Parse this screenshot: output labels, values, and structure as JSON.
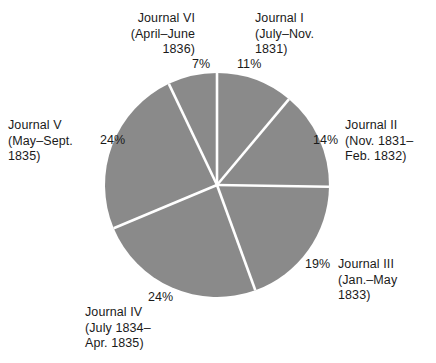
{
  "chart_data": {
    "type": "pie",
    "title": "",
    "labels": [
      "Journal I (July–Nov. 1831)",
      "Journal II (Nov. 1831–Feb. 1832)",
      "Journal III (Jan.–May 1833)",
      "Journal IV (July 1834–Apr. 1835)",
      "Journal V (May–Sept. 1835)",
      "Journal VI (April–June 1836)"
    ],
    "values": [
      11,
      14,
      19,
      24,
      24,
      7
    ],
    "units": "percent",
    "start_angle_deg": 0,
    "direction": "clockwise",
    "legend": "none",
    "slice_color": "#8a8a8a",
    "divider_color": "#ffffff"
  },
  "slices": [
    {
      "id": "journal-i",
      "name": "Journal I",
      "date_line1": "(July–Nov.",
      "date_line2": "1831)",
      "percent": "11%",
      "value": 11
    },
    {
      "id": "journal-ii",
      "name": "Journal II",
      "date_line1": "(Nov. 1831–",
      "date_line2": "Feb. 1832)",
      "percent": "14%",
      "value": 14
    },
    {
      "id": "journal-iii",
      "name": "Journal III",
      "date_line1": "(Jan.–May",
      "date_line2": "1833)",
      "percent": "19%",
      "value": 19
    },
    {
      "id": "journal-iv",
      "name": "Journal IV",
      "date_line1": "(July 1834–",
      "date_line2": "Apr. 1835)",
      "percent": "24%",
      "value": 24
    },
    {
      "id": "journal-v",
      "name": "Journal V",
      "date_line1": "(May–Sept.",
      "date_line2": "1835)",
      "percent": "24%",
      "value": 24
    },
    {
      "id": "journal-vi",
      "name": "Journal VI",
      "date_line1": "(April–June",
      "date_line2": "1836)",
      "percent": "7%",
      "value": 7
    }
  ],
  "geometry": {
    "cx": 217,
    "cy": 185,
    "r": 112
  },
  "colors": {
    "slice": "#8a8a8a",
    "divider": "#ffffff",
    "text": "#1a1a1a",
    "background": "#ffffff"
  }
}
